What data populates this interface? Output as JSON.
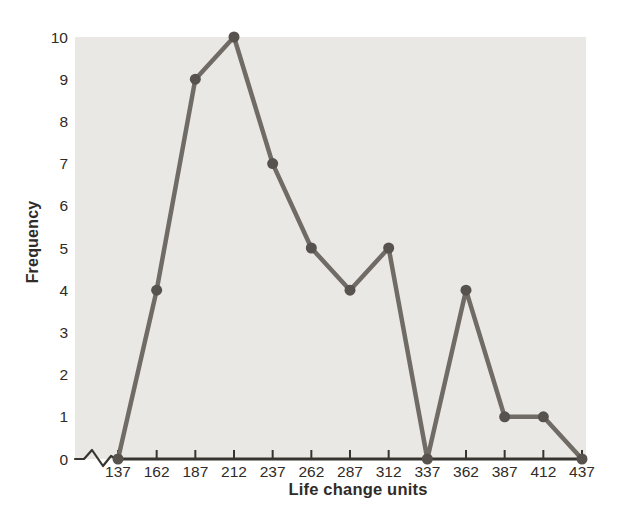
{
  "chart_data": {
    "type": "line",
    "x": [
      137,
      162,
      187,
      212,
      237,
      262,
      287,
      312,
      337,
      362,
      387,
      412,
      437
    ],
    "values": [
      0,
      4,
      9,
      10,
      7,
      5,
      4,
      5,
      0,
      4,
      1,
      1,
      0
    ],
    "title": "",
    "xlabel": "Life change units",
    "ylabel": "Frequency",
    "xlim": [
      137,
      437
    ],
    "ylim": [
      0,
      10
    ],
    "yticks": [
      0,
      1,
      2,
      3,
      4,
      5,
      6,
      7,
      8,
      9,
      10
    ],
    "grid": false,
    "legend": "none",
    "axis_break_on_x": true,
    "colors": {
      "plot_background": "#e9e8e4",
      "line": "#716b66",
      "marker": "#57524d",
      "axis": "#38342f",
      "text": "#2f2b28"
    }
  }
}
